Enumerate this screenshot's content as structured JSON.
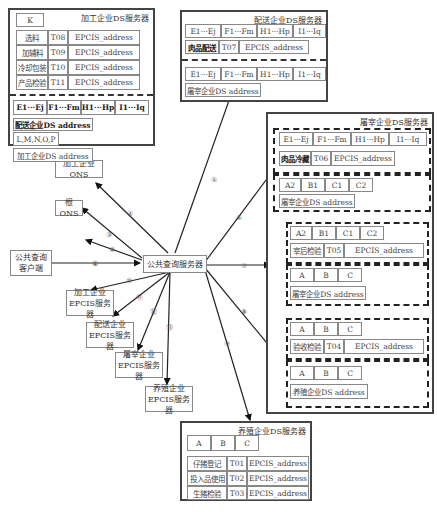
{
  "central": {
    "label": "公共查询服务器"
  },
  "client": {
    "line1": "公共查询",
    "line2": "客户端"
  },
  "root_ons": {
    "label": "根ONS"
  },
  "proc_ons": {
    "label": "加工企业ONS"
  },
  "epcis": [
    {
      "line1": "加工企业",
      "line2": "EPCIS服务器"
    },
    {
      "line1": "配送企业",
      "line2": "EPCIS服务器"
    },
    {
      "line1": "屠宰企业",
      "line2": "EPCIS服务器"
    },
    {
      "line1": "养殖企业",
      "line2": "EPCIS服务器"
    }
  ],
  "arrows": [
    "①",
    "②",
    "③",
    "④",
    "⑤",
    "⑥",
    "⑦",
    "⑧",
    "⑨",
    "⑩",
    "⑪",
    "⑫",
    "⑬"
  ],
  "proc_ds": {
    "title": "加工企业DS服务器",
    "key": "K",
    "rows": [
      {
        "name": "选料",
        "code": "T08",
        "addr": "EPCIS_address"
      },
      {
        "name": "加辅料",
        "code": "T09",
        "addr": "EPCIS_address"
      },
      {
        "name": "冷却包装",
        "code": "T10",
        "addr": "EPCIS_address"
      },
      {
        "name": "产品检验",
        "code": "T11",
        "addr": "EPCIS_address"
      }
    ],
    "ranges": [
      "E1···Ej",
      "F1···Fm",
      "H1···Hp",
      "I1···Iq"
    ],
    "next_addr": "配送企业DS address",
    "sub_key": "L,M,N,O,P",
    "self_addr": "加工企业DS address"
  },
  "dist_ds": {
    "title": "配送企业DS服务器",
    "ranges1": [
      "E1···Ej",
      "F1···Fm",
      "H1···Hp",
      "I1···Iq"
    ],
    "row": {
      "name": "肉品配送",
      "code": "T07",
      "addr": "EPCIS_address"
    },
    "ranges2": [
      "E1···Ej",
      "F1···Fm",
      "H1···Hp",
      "I1···Iq"
    ],
    "prev_addr": "屠宰企业DS address"
  },
  "slaughter_ds": {
    "title": "屠宰企业DS服务器",
    "ranges": [
      "E1···Ej",
      "F1···Fm",
      "H1···Hp",
      "I1···Iq"
    ],
    "row1": {
      "name": "肉品冷藏",
      "code": "T06",
      "addr": "EPCIS_address"
    },
    "keys1": [
      "A2",
      "B1",
      "C1",
      "C2"
    ],
    "addr1": "屠宰企业DS address",
    "keys2": [
      "A2",
      "B1",
      "C1",
      "C2"
    ],
    "row2": {
      "name": "宰后检验",
      "code": "T05",
      "addr": "EPCIS_address"
    },
    "keys3": [
      "A",
      "B",
      "C"
    ],
    "addr2": "屠宰企业DS address",
    "keys4": [
      "A",
      "B",
      "C"
    ],
    "row3": {
      "name": "验收检验",
      "code": "T04",
      "addr": "EPCIS_address"
    },
    "keys5": [
      "A",
      "B",
      "C"
    ],
    "addr3": "养殖企业DS address"
  },
  "farm_ds": {
    "title": "养殖企业DS服务器",
    "keys": [
      "A",
      "B",
      "C"
    ],
    "rows": [
      {
        "name": "仔猪登记",
        "code": "T01",
        "addr": "EPCIS_address"
      },
      {
        "name": "投入品使用",
        "code": "T02",
        "addr": "EPCIS_address"
      },
      {
        "name": "生猪检验",
        "code": "T03",
        "addr": "EPCIS_address"
      }
    ]
  }
}
